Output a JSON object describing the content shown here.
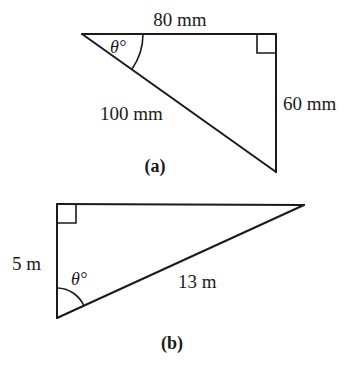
{
  "figure_a": {
    "caption": "(a)",
    "top_side_label": "80 mm",
    "hypotenuse_label": "100 mm",
    "right_side_label": "60 mm",
    "angle_label": "θ°"
  },
  "figure_b": {
    "caption": "(b)",
    "left_side_label": "5 m",
    "hypotenuse_label": "13 m",
    "angle_label": "θ°"
  }
}
